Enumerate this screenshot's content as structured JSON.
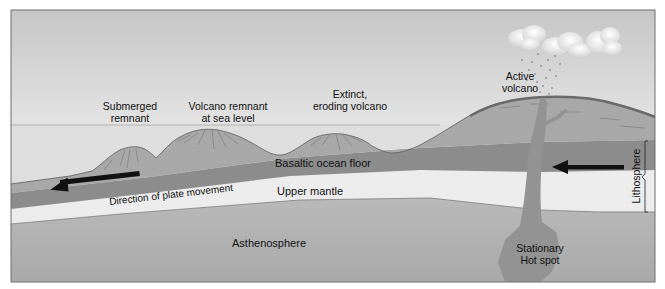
{
  "diagram": {
    "labels": {
      "submerged_remnant": "Submerged\nremnant",
      "submerged_remnant_l1": "Submerged",
      "submerged_remnant_l2": "remnant",
      "volcano_remnant_l1": "Volcano remnant",
      "volcano_remnant_l2": "at sea level",
      "extinct_l1": "Extinct,",
      "extinct_l2": "eroding volcano",
      "active_l1": "Active",
      "active_l2": "volcano",
      "basaltic_floor": "Basaltic ocean floor",
      "upper_mantle": "Upper mantle",
      "direction": "Direction of plate movement",
      "asthenosphere": "Asthenosphere",
      "hotspot_l1": "Stationary",
      "hotspot_l2": "Hot spot",
      "lithosphere": "Lithosphere"
    },
    "colors": {
      "sky_top": "#c9c9c9",
      "sky_bottom": "#f2f2f2",
      "sea": "#dcdcdc",
      "crust_land": "#a9a9a9",
      "basalt": "#8a8a8a",
      "mantle": "#ececec",
      "asthenosphere": "#b3b3b3",
      "plume": "#959595",
      "arrow": "#111111",
      "frame": "#6e6e6e"
    }
  }
}
